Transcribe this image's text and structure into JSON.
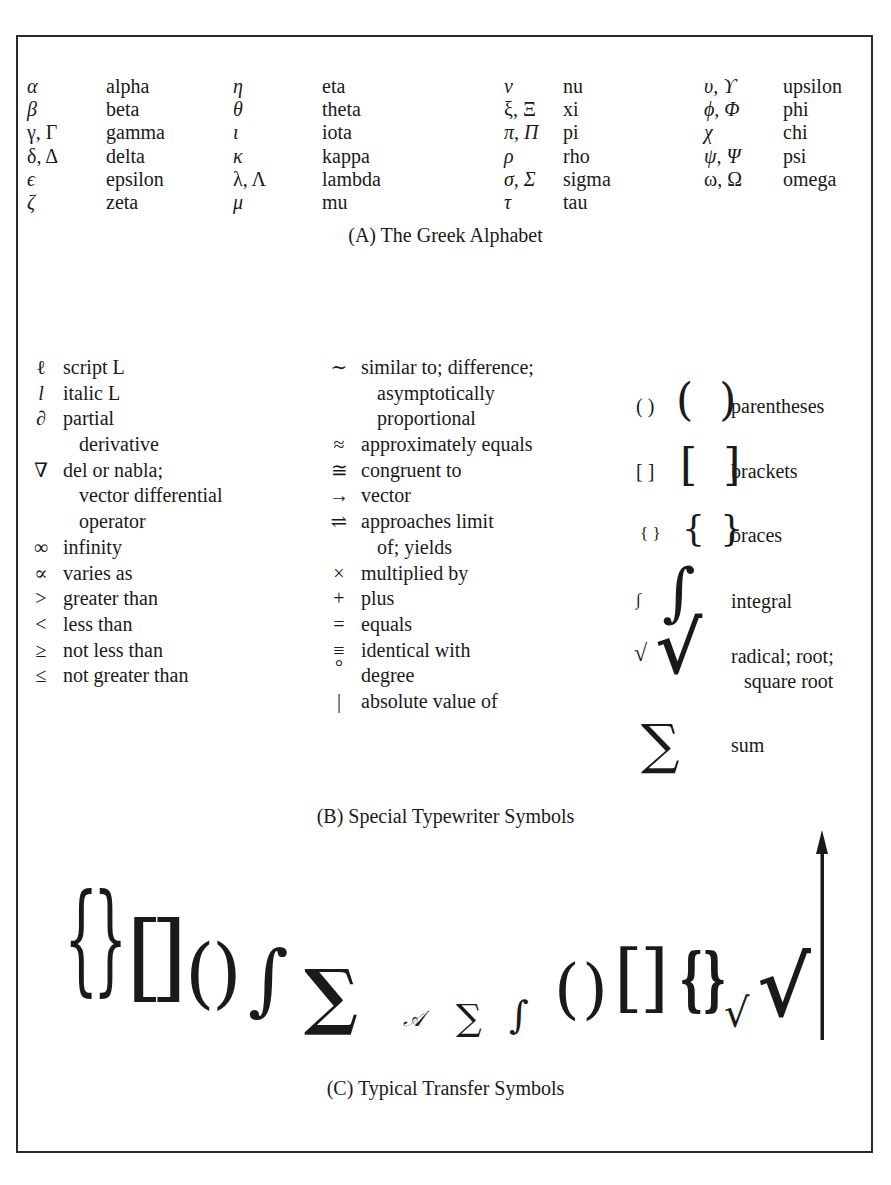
{
  "section_a": {
    "caption": "(A)  The Greek Alphabet",
    "columns": [
      [
        {
          "symbol": "α",
          "name": "alpha"
        },
        {
          "symbol": "β",
          "name": "beta"
        },
        {
          "symbol": "γ, Γ",
          "name": "gamma"
        },
        {
          "symbol": "δ, Δ",
          "name": "delta"
        },
        {
          "symbol": "ϵ",
          "name": "epsilon"
        },
        {
          "symbol": "ζ",
          "name": "zeta"
        }
      ],
      [
        {
          "symbol": "η",
          "name": "eta"
        },
        {
          "symbol": "θ",
          "name": "theta"
        },
        {
          "symbol": "ι",
          "name": "iota"
        },
        {
          "symbol": "κ",
          "name": "kappa"
        },
        {
          "symbol": "λ, Λ",
          "name": "lambda"
        },
        {
          "symbol": "μ",
          "name": "mu"
        }
      ],
      [
        {
          "symbol": "ν",
          "name": "nu"
        },
        {
          "symbol": "ξ, Ξ",
          "name": "xi"
        },
        {
          "symbol": "π, Π",
          "name": "pi"
        },
        {
          "symbol": "ρ",
          "name": "rho"
        },
        {
          "symbol": "σ, Σ",
          "name": "sigma"
        },
        {
          "symbol": "τ",
          "name": "tau"
        }
      ],
      [
        {
          "symbol": "υ, ϒ",
          "name": "upsilon"
        },
        {
          "symbol": "ϕ, Φ",
          "name": "phi"
        },
        {
          "symbol": "χ",
          "name": "chi"
        },
        {
          "symbol": "ψ, Ψ",
          "name": "psi"
        },
        {
          "symbol": "ω, Ω",
          "name": "omega"
        }
      ]
    ]
  },
  "section_b": {
    "caption": "(B)  Special Typewriter Symbols",
    "left": [
      {
        "symbol": "ℓ",
        "text": "script L"
      },
      {
        "symbol": "l",
        "text": "italic L"
      },
      {
        "symbol": "∂",
        "text": "partial"
      },
      {
        "symbol": "",
        "text": "derivative",
        "indent": true
      },
      {
        "symbol": "∇",
        "text": "del or nabla;"
      },
      {
        "symbol": "",
        "text": "vector differential",
        "indent": true
      },
      {
        "symbol": "",
        "text": "operator",
        "indent": true
      },
      {
        "symbol": "∞",
        "text": "infinity"
      },
      {
        "symbol": "∝",
        "text": "varies as"
      },
      {
        "symbol": ">",
        "text": "greater than"
      },
      {
        "symbol": "<",
        "text": "less than"
      },
      {
        "symbol": "≥",
        "text": "not less than"
      },
      {
        "symbol": "≤",
        "text": "not greater than"
      }
    ],
    "middle": [
      {
        "symbol": "∼",
        "text": "similar to; difference;"
      },
      {
        "symbol": "",
        "text": "asymptotically",
        "indent": true
      },
      {
        "symbol": "",
        "text": "proportional",
        "indent": true
      },
      {
        "symbol": "≈",
        "text": "approximately equals"
      },
      {
        "symbol": "≅",
        "text": "congruent to"
      },
      {
        "symbol": "→",
        "text": "vector"
      },
      {
        "symbol": "⇌",
        "text": "approaches limit"
      },
      {
        "symbol": "",
        "text": "of; yields",
        "indent": true
      },
      {
        "symbol": "×",
        "text": "multiplied by"
      },
      {
        "symbol": "+",
        "text": "plus"
      },
      {
        "symbol": "=",
        "text": "equals"
      },
      {
        "symbol": "≡",
        "text": "identical with"
      },
      {
        "symbol": "°",
        "text": "degree"
      },
      {
        "symbol": "|",
        "text": "absolute value of"
      }
    ],
    "right": [
      {
        "small": "( )",
        "large": "( )",
        "label": "parentheses"
      },
      {
        "small": "[ ]",
        "large": "[ ]",
        "label": "brackets"
      },
      {
        "small": "{ }",
        "large": "{ }",
        "label": "braces"
      },
      {
        "small": "∫",
        "large": "∫",
        "label": "integral"
      },
      {
        "small": "√",
        "large": "√",
        "label": "radical; root;",
        "label2": "square root"
      },
      {
        "small": "",
        "large": "∑",
        "label": "sum"
      }
    ]
  },
  "section_c": {
    "caption": "(C)  Typical Transfer Symbols",
    "glyphs": [
      "{",
      "}",
      "[",
      "]",
      "(",
      ")",
      "∫",
      "∑",
      "𝒜",
      "∑",
      "∫",
      "(",
      ")",
      "[",
      "]",
      "{",
      "}",
      "√",
      "√",
      "↑"
    ]
  }
}
